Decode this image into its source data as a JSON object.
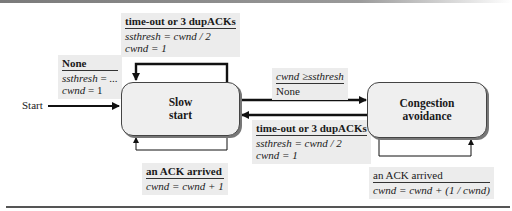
{
  "diagram": {
    "type": "state-machine",
    "title": "",
    "start_label": "Start",
    "states": [
      {
        "id": "slow_start",
        "line1": "Slow",
        "line2": "start"
      },
      {
        "id": "congestion_avoidance",
        "line1": "Congestion",
        "line2": "avoidance"
      }
    ],
    "transitions": {
      "initial": {
        "event": "None",
        "action1_lhs": "ssthresh",
        "action1_rhs": " = ...",
        "action2_lhs": "cwnd",
        "action2_rhs": " = 1"
      },
      "ss_self_timeout": {
        "event": "time-out or 3 dupACKs",
        "action1": "ssthresh = cwnd / 2",
        "action2": "cwnd = 1"
      },
      "ss_self_ack": {
        "event": "an ACK arrived",
        "action1": "cwnd = cwnd + 1"
      },
      "ss_to_ca": {
        "event": "cwnd ≥ssthresh",
        "action1": "None"
      },
      "ca_to_ss": {
        "event": "time-out or 3 dupACKs",
        "action1": "ssthresh = cwnd / 2",
        "action2": "cwnd = 1"
      },
      "ca_self_ack": {
        "event": "an ACK arrived",
        "action1": "cwnd = cwnd + (1 / cwnd)"
      }
    }
  }
}
